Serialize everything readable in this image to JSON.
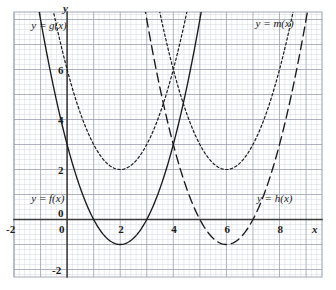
{
  "chart_data": {
    "type": "line",
    "title": "",
    "subtitle": "",
    "xlabel": "x",
    "ylabel": "y",
    "xlim": [
      -2.0,
      9.6
    ],
    "ylim": [
      -2.3,
      8.3
    ],
    "grid": true,
    "grid_major_step": 1,
    "grid_minor_step": 0.2,
    "legend_position": "inline-annotations",
    "x_ticks": [
      -2,
      0,
      2,
      4,
      6,
      8
    ],
    "x_tick_labels": [
      "-2",
      "0",
      "2",
      "4",
      "6",
      "8"
    ],
    "y_ticks": [
      -2,
      0,
      2,
      4,
      6
    ],
    "y_tick_labels": [
      "-2",
      "0",
      "2",
      "4",
      "6"
    ],
    "series": [
      {
        "name": "f",
        "label": "y = f(x)",
        "style": "solid",
        "vertex_x": 2,
        "vertex_y": -1,
        "a": 1,
        "x_start": -1.3,
        "x_end": 5.8,
        "values": [
          {
            "x": -1.3,
            "y": 9.89
          },
          {
            "x": -1.0,
            "y": 8.0
          },
          {
            "x": -0.5,
            "y": 5.25
          },
          {
            "x": 0.0,
            "y": 3.0
          },
          {
            "x": 0.5,
            "y": 1.25
          },
          {
            "x": 1.0,
            "y": 0.0
          },
          {
            "x": 1.5,
            "y": -0.75
          },
          {
            "x": 2.0,
            "y": -1.0
          },
          {
            "x": 2.5,
            "y": -0.75
          },
          {
            "x": 3.0,
            "y": 0.0
          },
          {
            "x": 3.5,
            "y": 1.25
          },
          {
            "x": 4.0,
            "y": 3.0
          },
          {
            "x": 4.5,
            "y": 5.25
          },
          {
            "x": 5.0,
            "y": 8.0
          },
          {
            "x": 5.8,
            "y": 13.44
          }
        ]
      },
      {
        "name": "g",
        "label": "y = g(x)",
        "style": "dotted",
        "vertex_x": 2,
        "vertex_y": 2,
        "a": 1,
        "x_start": -1.6,
        "x_end": 5.6,
        "values": [
          {
            "x": -1.6,
            "y": 14.96
          },
          {
            "x": -1.0,
            "y": 11.0
          },
          {
            "x": -0.5,
            "y": 8.25
          },
          {
            "x": 0.0,
            "y": 6.0
          },
          {
            "x": 0.5,
            "y": 4.25
          },
          {
            "x": 1.0,
            "y": 3.0
          },
          {
            "x": 1.5,
            "y": 2.25
          },
          {
            "x": 2.0,
            "y": 2.0
          },
          {
            "x": 2.5,
            "y": 2.25
          },
          {
            "x": 3.0,
            "y": 3.0
          },
          {
            "x": 3.5,
            "y": 4.25
          },
          {
            "x": 4.0,
            "y": 6.0
          },
          {
            "x": 4.5,
            "y": 8.25
          },
          {
            "x": 5.0,
            "y": 11.0
          },
          {
            "x": 5.6,
            "y": 14.96
          }
        ]
      },
      {
        "name": "h",
        "label": "y = h(x)",
        "style": "dashed",
        "vertex_x": 6,
        "vertex_y": -1,
        "a": 1,
        "x_start": 2.6,
        "x_end": 9.6,
        "values": [
          {
            "x": 2.6,
            "y": 10.56
          },
          {
            "x": 3.0,
            "y": 8.0
          },
          {
            "x": 3.5,
            "y": 5.25
          },
          {
            "x": 4.0,
            "y": 3.0
          },
          {
            "x": 4.5,
            "y": 1.25
          },
          {
            "x": 5.0,
            "y": 0.0
          },
          {
            "x": 5.5,
            "y": -0.75
          },
          {
            "x": 6.0,
            "y": -1.0
          },
          {
            "x": 6.5,
            "y": -0.75
          },
          {
            "x": 7.0,
            "y": 0.0
          },
          {
            "x": 7.5,
            "y": 1.25
          },
          {
            "x": 8.0,
            "y": 3.0
          },
          {
            "x": 8.5,
            "y": 5.25
          },
          {
            "x": 9.0,
            "y": 8.0
          },
          {
            "x": 9.6,
            "y": 11.96
          }
        ]
      },
      {
        "name": "m",
        "label": "y = m(x)",
        "style": "dotted",
        "vertex_x": 6,
        "vertex_y": 2,
        "a": 1,
        "x_start": 2.4,
        "x_end": 9.4,
        "values": [
          {
            "x": 2.4,
            "y": 14.96
          },
          {
            "x": 3.0,
            "y": 11.0
          },
          {
            "x": 3.5,
            "y": 8.25
          },
          {
            "x": 4.0,
            "y": 6.0
          },
          {
            "x": 4.5,
            "y": 4.25
          },
          {
            "x": 5.0,
            "y": 3.0
          },
          {
            "x": 5.5,
            "y": 2.25
          },
          {
            "x": 6.0,
            "y": 2.0
          },
          {
            "x": 6.5,
            "y": 2.25
          },
          {
            "x": 7.0,
            "y": 3.0
          },
          {
            "x": 7.5,
            "y": 4.25
          },
          {
            "x": 8.0,
            "y": 6.0
          },
          {
            "x": 8.5,
            "y": 8.25
          },
          {
            "x": 9.0,
            "y": 11.0
          },
          {
            "x": 9.4,
            "y": 13.56
          }
        ]
      }
    ],
    "annotations": [
      {
        "name": "label-g",
        "text": "y = g(x)",
        "x": -1.35,
        "y": 8.0
      },
      {
        "name": "label-m",
        "text": "y = m(x)",
        "x": 7.1,
        "y": 8.05
      },
      {
        "name": "label-f",
        "text": "y = f(x)",
        "x": -1.35,
        "y": 1.05
      },
      {
        "name": "label-h",
        "text": "y = h(x)",
        "x": 7.15,
        "y": 1.05
      }
    ],
    "colors": {
      "curve": "#1a1a1a",
      "axis": "#3a3a3a",
      "grid_major": "#9aa0b0",
      "grid_minor": "#d2d6e0",
      "background": "#ffffff"
    }
  },
  "axes": {
    "x_axis_label": "x",
    "y_axis_label": "y"
  },
  "ticks": {
    "x": [
      "-2",
      "0",
      "2",
      "4",
      "6",
      "8"
    ],
    "y": [
      "6",
      "4",
      "2",
      "0",
      "-2"
    ]
  },
  "labels": {
    "g": "y = g(x)",
    "m": "y = m(x)",
    "f": "y = f(x)",
    "h": "y = h(x)"
  }
}
